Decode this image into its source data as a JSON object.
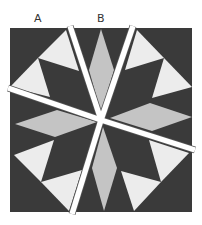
{
  "diagram": {
    "labels": [
      {
        "text": "A",
        "x": 34
      },
      {
        "text": "B",
        "x": 97
      }
    ],
    "colors": {
      "dark": "#3a3a3a",
      "light": "#ececec",
      "medium": "#c4c4c4",
      "gap": "#ffffff",
      "outline": "#555555"
    },
    "square": {
      "x": 10,
      "y": 28,
      "w": 182,
      "h": 184
    },
    "light_triangles": [
      "66,30 38,58 79,71",
      "38,58 10,87 50,97",
      "137,30 125,70 164,58",
      "164,58 152,98 192,87",
      "14,155 54,140 41,182",
      "41,182 82,170 69,211",
      "149,140 189,153 161,182",
      "121,171 161,182 134,211"
    ],
    "diamonds": [
      "101,29 89,70 101,113 114,70",
      "103,127 92,168 104,211 117,168",
      "15,124 57,110 97,122 55,137",
      "110,118 150,103 192,117 152,131"
    ],
    "cuts": [
      {
        "name": "cut-top-left",
        "x1": 70,
        "y1": 26,
        "x2": 101,
        "y2": 120
      },
      {
        "name": "cut-top-right",
        "x1": 133,
        "y1": 26,
        "x2": 101,
        "y2": 120
      },
      {
        "name": "cut-left",
        "x1": 8,
        "y1": 88,
        "x2": 101,
        "y2": 120
      },
      {
        "name": "cut-right",
        "x1": 101,
        "y1": 120,
        "x2": 195,
        "y2": 150
      },
      {
        "name": "cut-bottom",
        "x1": 101,
        "y1": 120,
        "x2": 72,
        "y2": 214
      }
    ]
  }
}
